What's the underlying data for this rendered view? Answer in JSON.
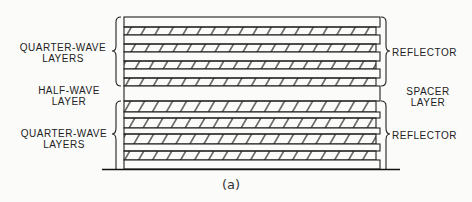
{
  "diagram": {
    "caption": "(a)",
    "labels": {
      "top_left": [
        "QUARTER-WAVE",
        "LAYERS"
      ],
      "middle_left": [
        "HALF-WAVE",
        "LAYER"
      ],
      "bottom_left": [
        "QUARTER-WAVE",
        "LAYERS"
      ],
      "top_right": "REFLECTOR",
      "middle_right": [
        "SPACER",
        "LAYER"
      ],
      "bottom_right": "REFLECTOR"
    },
    "layers": [
      {
        "type": "clear",
        "y": 17,
        "h": 10
      },
      {
        "type": "hatched",
        "y": 27,
        "h": 8
      },
      {
        "type": "clear",
        "y": 35,
        "h": 9
      },
      {
        "type": "hatched",
        "y": 44,
        "h": 8
      },
      {
        "type": "clear",
        "y": 52,
        "h": 9
      },
      {
        "type": "hatched",
        "y": 61,
        "h": 8
      },
      {
        "type": "clear",
        "y": 69,
        "h": 9
      },
      {
        "type": "hatched",
        "y": 78,
        "h": 8
      },
      {
        "type": "clear",
        "y": 86,
        "h": 15
      },
      {
        "type": "hatched",
        "y": 101,
        "h": 11
      },
      {
        "type": "clear",
        "y": 112,
        "h": 6
      },
      {
        "type": "hatched",
        "y": 118,
        "h": 10
      },
      {
        "type": "clear",
        "y": 128,
        "h": 6
      },
      {
        "type": "hatched",
        "y": 134,
        "h": 10
      },
      {
        "type": "clear",
        "y": 144,
        "h": 7
      },
      {
        "type": "hatched",
        "y": 151,
        "h": 9
      },
      {
        "type": "clear",
        "y": 160,
        "h": 9
      }
    ]
  }
}
